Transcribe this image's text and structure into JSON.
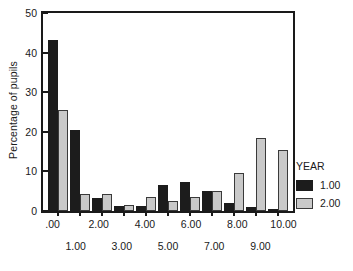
{
  "chart_data": {
    "type": "bar",
    "title": "",
    "xlabel": "",
    "ylabel": "Percentage of pupils",
    "ylim": [
      0,
      50
    ],
    "yticks": [
      0,
      10,
      20,
      30,
      40,
      50
    ],
    "ytick_labels": [
      "0",
      "10",
      "20",
      "30",
      "40",
      "50"
    ],
    "grid": false,
    "legend_position": "right",
    "legend_title": "YEAR",
    "categories": [
      ".00",
      "1.00",
      "2.00",
      "3.00",
      "4.00",
      "5.00",
      "6.00",
      "7.00",
      "8.00",
      "9.00",
      "10.00"
    ],
    "xtick_labels_row1": [
      ".00",
      "2.00",
      "4.00",
      "6.00",
      "8.00",
      "10.00"
    ],
    "xtick_labels_row2": [
      "1.00",
      "3.00",
      "5.00",
      "7.00",
      "9.00"
    ],
    "series": [
      {
        "name": "1.00",
        "color": "#1c1c1c",
        "values": [
          43.3,
          20.4,
          3.3,
          1.2,
          1.2,
          6.5,
          7.4,
          5.1,
          2.1,
          1.1,
          0.5
        ]
      },
      {
        "name": "2.00",
        "color": "#c9c9c9",
        "values": [
          25.5,
          4.3,
          4.3,
          1.5,
          3.6,
          2.5,
          3.5,
          5.1,
          9.6,
          18.4,
          15.3
        ]
      }
    ]
  },
  "legend": {
    "title": "YEAR",
    "entries": [
      {
        "label": "1.00",
        "swatch": "black-swatch"
      },
      {
        "label": "2.00",
        "swatch": "gray-swatch"
      }
    ]
  },
  "axes": {
    "y_title": "Percentage of pupils"
  }
}
